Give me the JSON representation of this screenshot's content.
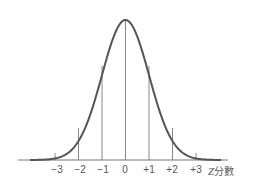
{
  "diagram": {
    "type": "normal-distribution-curve",
    "axis_label_var": "Z",
    "axis_label_text": "分數",
    "tick_labels": [
      "−3",
      "−2",
      "−1",
      "0",
      "+1",
      "+2",
      "+3"
    ],
    "colors": {
      "curve": "#555555",
      "lines": "#777777",
      "text": "#555555"
    }
  }
}
